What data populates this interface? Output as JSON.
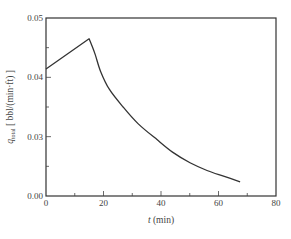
{
  "chart_data": {
    "type": "line",
    "title": "",
    "xlabel": "t (min)",
    "ylabel": "q_total [bbl/(min·ft)]",
    "ylabel_parts": {
      "symbol": "q",
      "subscript": "total",
      "unit": "[ bbl/(min·ft) ]"
    },
    "xlim": [
      0,
      80
    ],
    "ylim_visible_labels": [
      "0.00",
      "0.03",
      "0.04",
      "0.05"
    ],
    "ylim": [
      0.02,
      0.05
    ],
    "x_ticks": [
      0,
      20,
      40,
      60,
      80
    ],
    "x_minor_ticks": [
      10,
      30,
      50,
      70
    ],
    "y_ticks": [
      {
        "value": 0.02,
        "label": "0.00"
      },
      {
        "value": 0.03,
        "label": "0.03"
      },
      {
        "value": 0.04,
        "label": "0.04"
      },
      {
        "value": 0.05,
        "label": "0.05"
      }
    ],
    "y_minor_ticks": [
      0.025,
      0.035,
      0.045
    ],
    "grid": false,
    "legend": null,
    "series": [
      {
        "name": "q_total",
        "points": [
          [
            0,
            0.0414
          ],
          [
            15,
            0.0465
          ],
          [
            17,
            0.044
          ],
          [
            19,
            0.041
          ],
          [
            22,
            0.038
          ],
          [
            26.8,
            0.035
          ],
          [
            32,
            0.0322
          ],
          [
            38.6,
            0.0295
          ],
          [
            44,
            0.0274
          ],
          [
            50.1,
            0.0256
          ],
          [
            56,
            0.0243
          ],
          [
            62,
            0.0233
          ],
          [
            67.5,
            0.0224
          ]
        ]
      }
    ]
  }
}
